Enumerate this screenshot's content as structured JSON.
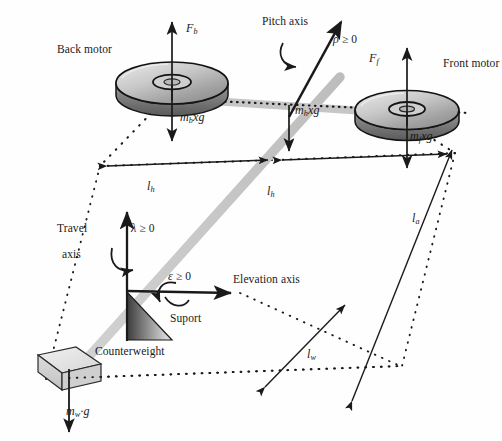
{
  "figure": {
    "type": "free-body-diagram",
    "background_color": "#fefefe",
    "ink_color": "#1a1a1a",
    "beam_color": "#c8c8c8",
    "disc_fill_light": "#d9d9d9",
    "disc_fill_dark": "#8f8f8f"
  },
  "labels": {
    "back_motor": "Back motor",
    "front_motor": "Front motor",
    "pitch_axis": "Pitch axis",
    "travel_line1": "Travel",
    "travel_line2": "axis",
    "elevation_axis": "Elevation axis",
    "support": "Suport",
    "counterweight": "Counterweight"
  },
  "forces": {
    "back_thrust": {
      "sym": "F",
      "sub": "b"
    },
    "front_thrust": {
      "sym": "F",
      "sub": "f"
    },
    "back_weight": {
      "sym": "m",
      "sub": "b",
      "rest": "xg"
    },
    "hub_weight": {
      "sym": "m",
      "sub": "h",
      "rest": "xg"
    },
    "front_weight": {
      "sym": "m",
      "sub": "f",
      "rest": "xg"
    },
    "counterweight_weight": {
      "sym": "m",
      "sub": "w",
      "rest": "·g"
    }
  },
  "angles": {
    "pitch": {
      "sym": "ρ",
      "rel": "≥ 0"
    },
    "travel": {
      "sym": "λ",
      "rel": "≥ 0"
    },
    "elevation": {
      "sym": "ε",
      "rel": "≥ 0"
    }
  },
  "dimensions": {
    "back_arm": {
      "sym": "l",
      "sub": "h"
    },
    "front_arm": {
      "sym": "l",
      "sub": "h"
    },
    "main_arm": {
      "sym": "l",
      "sub": "a"
    },
    "counterweight_arm": {
      "sym": "l",
      "sub": "w"
    }
  }
}
